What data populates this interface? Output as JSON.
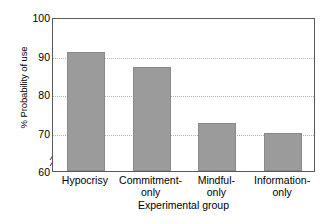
{
  "chart_data": {
    "type": "bar",
    "title": "",
    "subtitle": "",
    "xlabel": "Experimental group",
    "ylabel": "% Probability of use",
    "categories": [
      "Hypocrisy",
      "Commitment-only",
      "Mindful-only",
      "Information-only"
    ],
    "category_lines": [
      [
        "Hypocrisy",
        ""
      ],
      [
        "Commitment-",
        "only"
      ],
      [
        "Mindful-",
        "only"
      ],
      [
        "Information-",
        "only"
      ]
    ],
    "values": [
      91,
      87,
      72.5,
      70
    ],
    "ylim": [
      60,
      100
    ],
    "yticks": [
      100,
      90,
      80,
      70,
      60
    ],
    "ytick_labels": [
      "100",
      "90",
      "80",
      "70",
      "60"
    ],
    "grid": "horizontal-dotted",
    "axis_break": true,
    "axis_break_note": "y-axis broken below 60",
    "legend": "none",
    "bar_color": "#9b9b9b",
    "bar_edge_color": "#8a8a8a",
    "frame_color": "#5a5a5a",
    "grid_color": "#b4b4b4"
  }
}
